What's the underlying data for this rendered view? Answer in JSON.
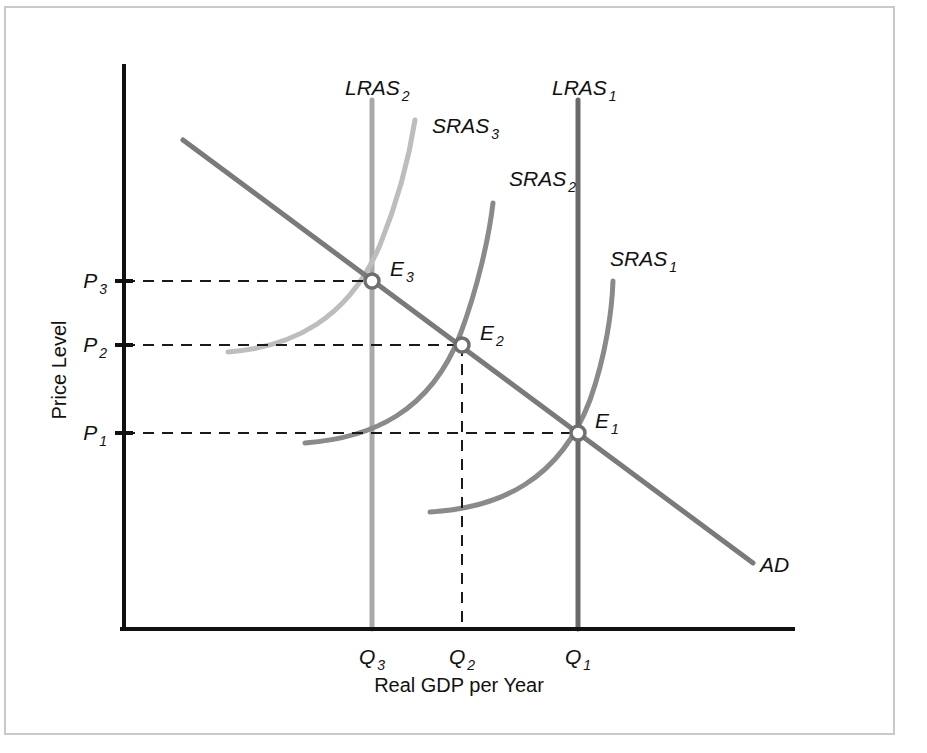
{
  "figure": {
    "kind": "ad-as-diagram",
    "background_color": "#ffffff",
    "frame_color": "#c9c9c9"
  },
  "axes": {
    "y_axis_title": "Price Level",
    "x_axis_title": "Real GDP per Year",
    "axis_color": "#111111",
    "origin_px": [
      124,
      629
    ],
    "x_axis_end_px": [
      793,
      629
    ],
    "y_axis_top_px": [
      124,
      66
    ]
  },
  "y_ticks": [
    {
      "label": "P",
      "sub": "3",
      "y_px": 281
    },
    {
      "label": "P",
      "sub": "2",
      "y_px": 345
    },
    {
      "label": "P",
      "sub": "1",
      "y_px": 433
    }
  ],
  "x_ticks": [
    {
      "label": "Q",
      "sub": "3",
      "x_px": 372
    },
    {
      "label": "Q",
      "sub": "2",
      "x_px": 462
    },
    {
      "label": "Q",
      "sub": "1",
      "x_px": 578
    }
  ],
  "curves": [
    {
      "name": "AD",
      "label": "AD",
      "sub": "",
      "color": "#7a7a7a",
      "width": 5,
      "path": "M 183 140 L 753 563",
      "label_px": [
        760,
        572
      ]
    },
    {
      "name": "LRAS1",
      "label": "LRAS",
      "sub": "1",
      "color": "#6a6a6a",
      "width": 5,
      "path": "M 578 100 L 578 629",
      "label_px": [
        552,
        95
      ]
    },
    {
      "name": "LRAS2",
      "label": "LRAS",
      "sub": "2",
      "color": "#a9a9a9",
      "width": 5,
      "path": "M 372 100 L 372 629",
      "label_px": [
        345,
        95
      ]
    },
    {
      "name": "SRAS1",
      "label": "SRAS",
      "sub": "1",
      "color": "#8a8a8a",
      "width": 5,
      "path": "M 430 512 C 500 508, 560 480, 590 400 C 606 355, 612 310, 613 281",
      "label_px": [
        610,
        266
      ]
    },
    {
      "name": "SRAS2",
      "label": "SRAS",
      "sub": "2",
      "color": "#8a8a8a",
      "width": 5,
      "path": "M 305 443 C 372 438, 430 412, 460 335 C 478 287, 489 237, 493 203",
      "label_px": [
        509,
        186
      ]
    },
    {
      "name": "SRAS3",
      "label": "SRAS",
      "sub": "3",
      "color": "#bdbdbd",
      "width": 5,
      "path": "M 228 352 C 292 347, 348 320, 380 245 C 399 198, 410 152, 415 120",
      "label_px": [
        432,
        133
      ]
    }
  ],
  "equilibria": [
    {
      "name": "E1",
      "label": "E",
      "sub": "1",
      "x_px": 578,
      "y_px": 433,
      "label_px": [
        595,
        428
      ]
    },
    {
      "name": "E2",
      "label": "E",
      "sub": "2",
      "x_px": 462,
      "y_px": 345,
      "label_px": [
        480,
        340
      ]
    },
    {
      "name": "E3",
      "label": "E",
      "sub": "3",
      "x_px": 372,
      "y_px": 281,
      "label_px": [
        390,
        276
      ]
    }
  ],
  "guides": [
    {
      "name": "p3-guide",
      "path": "M 124 281 L 372 281"
    },
    {
      "name": "p2-guide",
      "path": "M 124 345 L 462 345"
    },
    {
      "name": "p1-guide",
      "path": "M 124 433 L 578 433"
    },
    {
      "name": "q2-guide",
      "path": "M 462 345 L 462 629"
    }
  ],
  "chart_data": {
    "type": "line",
    "title": "",
    "subtitle": "",
    "xlabel": "Real GDP per Year",
    "ylabel": "Price Level",
    "grid": false,
    "legend": "inline-curve-labels",
    "xlim": [
      0,
      1
    ],
    "ylim": [
      0,
      1
    ],
    "x_tick_labels": [
      "Q3",
      "Q2",
      "Q1"
    ],
    "y_tick_labels": [
      "P3",
      "P2",
      "P1"
    ],
    "annotations": [
      "E1",
      "E2",
      "E3"
    ],
    "series": [
      {
        "name": "AD",
        "kind": "aggregate-demand",
        "shape": "downward-sloping straight line",
        "color": "#7a7a7a"
      },
      {
        "name": "LRAS1",
        "kind": "long-run-aggregate-supply",
        "shape": "vertical line at Q1",
        "color": "#6a6a6a"
      },
      {
        "name": "LRAS2",
        "kind": "long-run-aggregate-supply",
        "shape": "vertical line at Q3",
        "color": "#a9a9a9"
      },
      {
        "name": "SRAS1",
        "kind": "short-run-aggregate-supply",
        "shape": "upward-sloping convex curve through E1",
        "color": "#8a8a8a"
      },
      {
        "name": "SRAS2",
        "kind": "short-run-aggregate-supply",
        "shape": "upward-sloping convex curve through E2",
        "color": "#8a8a8a"
      },
      {
        "name": "SRAS3",
        "kind": "short-run-aggregate-supply",
        "shape": "upward-sloping convex curve through E3",
        "color": "#bdbdbd"
      }
    ],
    "equilibrium_points": [
      {
        "name": "E1",
        "price_level": "P1",
        "real_gdp": "Q1"
      },
      {
        "name": "E2",
        "price_level": "P2",
        "real_gdp": "Q2"
      },
      {
        "name": "E3",
        "price_level": "P3",
        "real_gdp": "Q3"
      }
    ]
  }
}
